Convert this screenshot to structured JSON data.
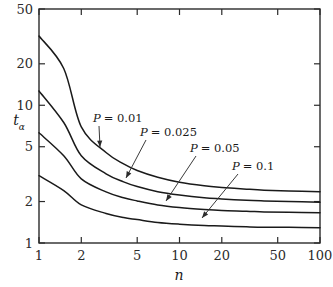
{
  "chart_data": {
    "type": "line",
    "title": "",
    "subtitle": "",
    "xlabel": "n",
    "ylabel": "t_alpha",
    "ylabel_main": "t",
    "ylabel_sub": "α",
    "xscale": "log",
    "yscale": "log",
    "xlim": [
      1,
      100
    ],
    "ylim": [
      1,
      50
    ],
    "grid": false,
    "legend": "inline-annotations",
    "xticks": [
      1,
      2,
      5,
      10,
      20,
      50,
      100
    ],
    "xtick_labels": [
      "1",
      "2",
      "5",
      "10",
      "20",
      "50",
      "100"
    ],
    "yticks": [
      1,
      2,
      5,
      10,
      20,
      50
    ],
    "ytick_labels": [
      "1",
      "2",
      "5",
      "10",
      "20",
      "50"
    ],
    "series": [
      {
        "name": "P = 0.01",
        "label": "P = 0.01",
        "label_var": "P",
        "label_eq": "= 0.01",
        "x": [
          1,
          1.5,
          2,
          3,
          4,
          5,
          7,
          10,
          15,
          20,
          30,
          40,
          60,
          100
        ],
        "values": [
          31.82,
          18.5,
          6.96,
          4.54,
          3.75,
          3.36,
          3.0,
          2.76,
          2.6,
          2.53,
          2.46,
          2.42,
          2.39,
          2.36
        ]
      },
      {
        "name": "P = 0.025",
        "label": "P = 0.025",
        "label_var": "P",
        "label_eq": "= 0.025",
        "x": [
          1,
          1.5,
          2,
          3,
          4,
          5,
          7,
          10,
          15,
          20,
          30,
          40,
          60,
          100
        ],
        "values": [
          12.71,
          7.5,
          4.3,
          3.18,
          2.78,
          2.57,
          2.36,
          2.23,
          2.13,
          2.09,
          2.04,
          2.02,
          2.0,
          1.98
        ]
      },
      {
        "name": "P = 0.05",
        "label": "P = 0.05",
        "label_var": "P",
        "label_eq": "= 0.05",
        "x": [
          1,
          1.5,
          2,
          3,
          4,
          5,
          7,
          10,
          15,
          20,
          30,
          40,
          60,
          100
        ],
        "values": [
          6.31,
          4.3,
          2.92,
          2.35,
          2.13,
          2.02,
          1.89,
          1.81,
          1.75,
          1.72,
          1.7,
          1.68,
          1.67,
          1.66
        ]
      },
      {
        "name": "P = 0.1",
        "label": "P = 0.1",
        "label_var": "P",
        "label_eq": "= 0.1",
        "x": [
          1,
          1.5,
          2,
          3,
          4,
          5,
          7,
          10,
          15,
          20,
          30,
          40,
          60,
          100
        ],
        "values": [
          3.08,
          2.4,
          1.89,
          1.64,
          1.53,
          1.48,
          1.41,
          1.37,
          1.34,
          1.33,
          1.31,
          1.3,
          1.3,
          1.29
        ]
      }
    ],
    "annotations": [
      {
        "text": "P = 0.01",
        "x_px": 93,
        "y_px": 122,
        "point_x_px": 100,
        "point_y_px": 147
      },
      {
        "text": "P = 0.025",
        "x_px": 140,
        "y_px": 136,
        "point_x_px": 126,
        "point_y_px": 178
      },
      {
        "text": "P = 0.05",
        "x_px": 190,
        "y_px": 152,
        "point_x_px": 166,
        "point_y_px": 201
      },
      {
        "text": "P = 0.1",
        "x_px": 232,
        "y_px": 170,
        "point_x_px": 202,
        "point_y_px": 218
      }
    ],
    "colors": {
      "background": "#ffffff",
      "axis": "#2b2b2b",
      "curve": "#1a1a1a",
      "text": "#1a1a1a",
      "leader": "#3a3a3a"
    }
  }
}
